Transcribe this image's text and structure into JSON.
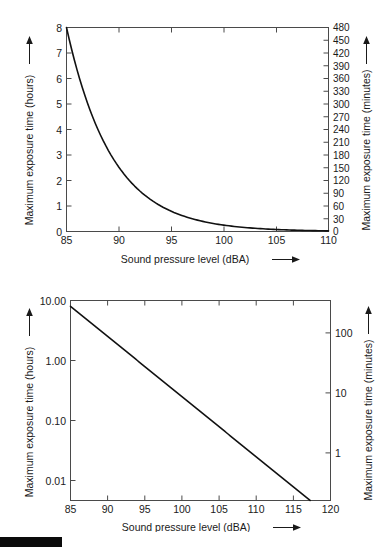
{
  "page": {
    "background_color": "#ffffff",
    "line_color": "#111111",
    "axis_color": "#4a4a4a",
    "text_color": "#1a1a1a"
  },
  "artifact": {
    "name": "black-crop-bar",
    "color": "#0b0b0b"
  },
  "figures": [
    {
      "id": "linear",
      "axis_titles": {
        "x": "Sound pressure level (dBA)",
        "y_left": "Maximum exposure time (hours)",
        "y_right": "Maximum exposure time (minutes)"
      },
      "arrow_glyph": "arrow-right",
      "x_ticks": [
        "85",
        "90",
        "95",
        "100",
        "105",
        "110"
      ],
      "y_left_ticks": [
        "0",
        "1",
        "2",
        "3",
        "4",
        "5",
        "6",
        "7",
        "8"
      ],
      "y_right_ticks": [
        "0",
        "30",
        "60",
        "90",
        "120",
        "150",
        "180",
        "210",
        "240",
        "270",
        "300",
        "330",
        "360",
        "390",
        "420",
        "450",
        "480"
      ]
    },
    {
      "id": "log",
      "axis_titles": {
        "x": "Sound pressure level (dBA)",
        "y_left": "Maximum exposure time (hours)",
        "y_right": "Maximum exposure time (minutes)"
      },
      "arrow_glyph": "arrow-right",
      "x_ticks": [
        "85",
        "90",
        "95",
        "100",
        "105",
        "110",
        "115",
        "120"
      ],
      "y_left_ticks": [
        "0.01",
        "0.10",
        "1.00",
        "10.00"
      ],
      "y_right_ticks": [
        "1",
        "10",
        "100"
      ]
    }
  ],
  "chart_data": [
    {
      "type": "line",
      "id": "linear-exposure-chart",
      "title": "",
      "xlabel": "Sound pressure level (dBA)",
      "ylabel": "Maximum exposure time (hours)",
      "ylabel_right": "Maximum exposure time (minutes)",
      "xlim": [
        85,
        110
      ],
      "ylim": [
        0,
        8
      ],
      "ylim_right": [
        0,
        480
      ],
      "xticks": [
        85,
        90,
        95,
        100,
        105,
        110
      ],
      "yticks": [
        0,
        1,
        2,
        3,
        4,
        5,
        6,
        7,
        8
      ],
      "yticks_right": [
        0,
        30,
        60,
        90,
        120,
        150,
        180,
        210,
        240,
        270,
        300,
        330,
        360,
        390,
        420,
        450,
        480
      ],
      "grid": false,
      "legend": null,
      "scale": "linear",
      "series": [
        {
          "name": "Maximum exposure time",
          "formula": "T = 8 / 2^((L-85)/3)",
          "x": [
            85,
            86,
            87,
            88,
            89,
            90,
            91,
            92,
            93,
            94,
            95,
            96,
            97,
            98,
            99,
            100,
            101,
            102,
            103,
            104,
            105,
            106,
            107,
            108,
            109,
            110
          ],
          "y": [
            8.0,
            6.35,
            5.04,
            4.0,
            3.17,
            2.52,
            2.0,
            1.59,
            1.26,
            1.0,
            0.79,
            0.63,
            0.5,
            0.4,
            0.31,
            0.25,
            0.2,
            0.157,
            0.125,
            0.099,
            0.079,
            0.063,
            0.05,
            0.039,
            0.031,
            0.025
          ]
        }
      ]
    },
    {
      "type": "line",
      "id": "log-exposure-chart",
      "title": "",
      "xlabel": "Sound pressure level (dBA)",
      "ylabel": "Maximum exposure time (hours)",
      "ylabel_right": "Maximum exposure time (minutes)",
      "xlim": [
        85,
        120
      ],
      "ylim": [
        0.005,
        10
      ],
      "ylim_right": [
        0.3,
        600
      ],
      "xticks": [
        85,
        90,
        95,
        100,
        105,
        110,
        115,
        120
      ],
      "yticks": [
        0.01,
        0.1,
        1.0,
        10.0
      ],
      "ytick_labels": [
        "0.01",
        "0.10",
        "1.00",
        "10.00"
      ],
      "yticks_right": [
        1,
        10,
        100
      ],
      "grid": false,
      "legend": null,
      "scale": "log",
      "series": [
        {
          "name": "Maximum exposure time",
          "formula": "T = 8 / 2^((L-85)/3)",
          "x": [
            85,
            90,
            95,
            100,
            105,
            110,
            115,
            117.3
          ],
          "y": [
            8.0,
            2.52,
            0.79,
            0.25,
            0.079,
            0.025,
            0.0079,
            0.0053
          ]
        }
      ]
    }
  ]
}
